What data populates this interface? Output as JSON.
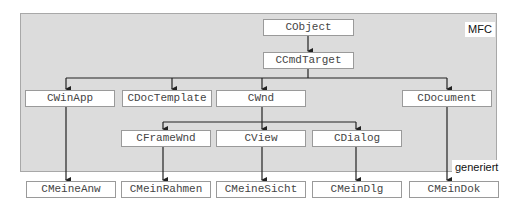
{
  "diagram": {
    "region_labels": {
      "mfc": "MFC",
      "generated": "generiert"
    },
    "classes": {
      "cobject": "CObject",
      "ccmdtarget": "CCmdTarget",
      "cwinapp": "CWinApp",
      "cdoctemplate": "CDocTemplate",
      "cwnd": "CWnd",
      "cdocument": "CDocument",
      "cframewnd": "CFrameWnd",
      "cview": "CView",
      "cdialog": "CDialog",
      "cmeineanw": "CMeineAnw",
      "cmeinrahmen": "CMeinRahmen",
      "cmeinesicht": "CMeineSicht",
      "cmeindlg": "CMeinDlg",
      "cmeindok": "CMeinDok"
    },
    "edges": [
      [
        "CObject",
        "CCmdTarget"
      ],
      [
        "CCmdTarget",
        "CWinApp"
      ],
      [
        "CCmdTarget",
        "CDocTemplate"
      ],
      [
        "CCmdTarget",
        "CWnd"
      ],
      [
        "CCmdTarget",
        "CDocument"
      ],
      [
        "CWnd",
        "CFrameWnd"
      ],
      [
        "CWnd",
        "CView"
      ],
      [
        "CWnd",
        "CDialog"
      ],
      [
        "CWinApp",
        "CMeineAnw"
      ],
      [
        "CFrameWnd",
        "CMeinRahmen"
      ],
      [
        "CView",
        "CMeineSicht"
      ],
      [
        "CDialog",
        "CMeinDlg"
      ],
      [
        "CDocument",
        "CMeinDok"
      ]
    ],
    "colors": {
      "panel": "#dcdcdc",
      "line": "#222222",
      "box_border": "#9a9a9a"
    }
  }
}
